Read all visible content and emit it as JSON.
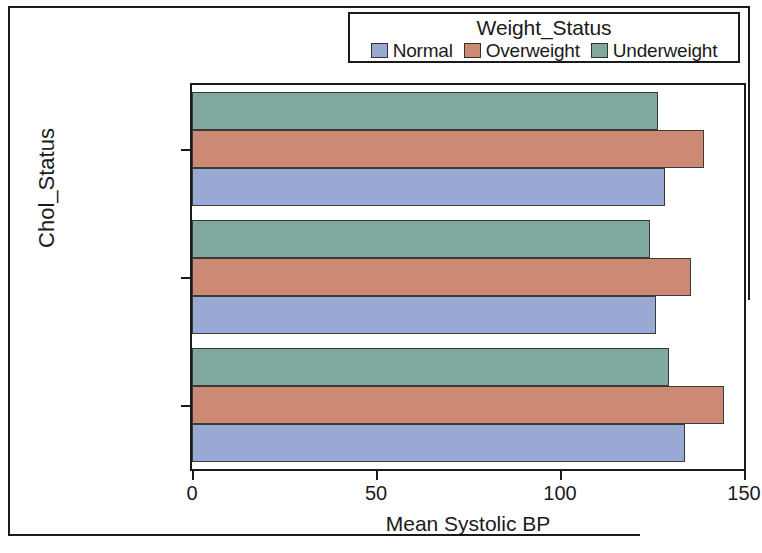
{
  "chart_data": {
    "type": "bar",
    "orientation": "horizontal",
    "title": "",
    "xlabel": "Mean Systolic BP",
    "ylabel": "Chol_Status",
    "categories": [
      "Borderline",
      "Desirable",
      "High"
    ],
    "series": [
      {
        "name": "Normal",
        "color": "#9aa8d4",
        "values": [
          128.5,
          126.0,
          134.0
        ]
      },
      {
        "name": "Overweight",
        "color": "#cc8974",
        "values": [
          139.0,
          135.5,
          144.5
        ]
      },
      {
        "name": "Underweight",
        "color": "#7fa89e",
        "values": [
          126.5,
          124.5,
          129.5
        ]
      }
    ],
    "legend": {
      "title": "Weight_Status",
      "position": "top-right",
      "entries": [
        {
          "label": "Normal",
          "color": "#9aa8d4"
        },
        {
          "label": "Overweight",
          "color": "#cc8974"
        },
        {
          "label": "Underweight",
          "color": "#7fa89e"
        }
      ]
    },
    "xlim": [
      0,
      150
    ],
    "xticks": [
      "0",
      "50",
      "100",
      "150"
    ],
    "xtick_values": [
      0,
      50,
      100,
      150
    ],
    "grid": false
  },
  "axes": {
    "x_title": "Mean Systolic BP",
    "y_title": "Chol_Status",
    "x_ticks": [
      "0",
      "50",
      "100",
      "150"
    ],
    "y_ticks": [
      "Borderline",
      "Desirable",
      "High"
    ]
  },
  "legend": {
    "title": "Weight_Status",
    "entry_0_label": "Normal",
    "entry_1_label": "Overweight",
    "entry_2_label": "Underweight"
  }
}
